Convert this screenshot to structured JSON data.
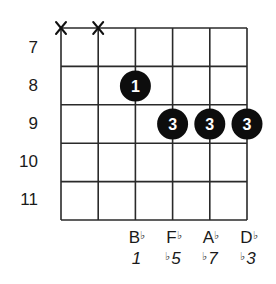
{
  "chord_diagram": {
    "strings": 6,
    "frets_shown": [
      7,
      8,
      9,
      10,
      11
    ],
    "fret_labels": [
      "7",
      "8",
      "9",
      "10",
      "11"
    ],
    "muted_strings": [
      1,
      2
    ],
    "muted_symbol": "X",
    "dots": [
      {
        "string": 3,
        "fret": 8,
        "finger": "1"
      },
      {
        "string": 4,
        "fret": 9,
        "finger": "3"
      },
      {
        "string": 5,
        "fret": 9,
        "finger": "3"
      },
      {
        "string": 6,
        "fret": 9,
        "finger": "3"
      }
    ],
    "notes": [
      {
        "string": 3,
        "name": "B",
        "accidental": "♭",
        "interval_prefix": "",
        "interval": "1"
      },
      {
        "string": 4,
        "name": "F",
        "accidental": "♭",
        "interval_prefix": "♭",
        "interval": "5"
      },
      {
        "string": 5,
        "name": "A",
        "accidental": "♭",
        "interval_prefix": "♭",
        "interval": "7"
      },
      {
        "string": 6,
        "name": "D",
        "accidental": "♭",
        "interval_prefix": "♭",
        "interval": "3"
      }
    ],
    "colors": {
      "grid": "#2a2a2a",
      "dot_fill": "#0d0d0d",
      "dot_text": "#ffffff",
      "label_text": "#1a1a1a",
      "background": "#ffffff"
    }
  }
}
